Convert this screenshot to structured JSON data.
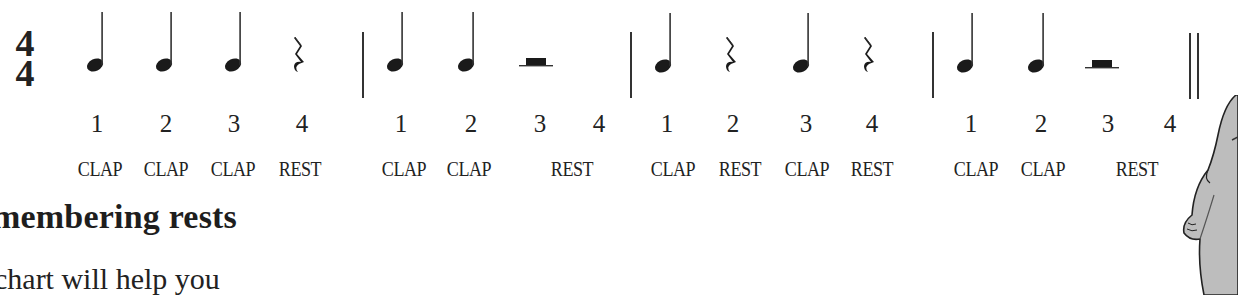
{
  "time_signature": {
    "top": "4",
    "bottom": "4"
  },
  "measures": [
    {
      "symbols": [
        {
          "type": "quarter-note",
          "beat": "1",
          "label": "CLAP"
        },
        {
          "type": "quarter-note",
          "beat": "2",
          "label": "CLAP"
        },
        {
          "type": "quarter-note",
          "beat": "3",
          "label": "CLAP"
        },
        {
          "type": "quarter-rest",
          "beat": "4",
          "label": "REST"
        }
      ]
    },
    {
      "symbols": [
        {
          "type": "quarter-note",
          "beat": "1",
          "label": "CLAP"
        },
        {
          "type": "quarter-note",
          "beat": "2",
          "label": "CLAP"
        },
        {
          "type": "half-rest",
          "beat": "3",
          "label": "REST"
        },
        {
          "type": "none",
          "beat": "4",
          "label": ""
        }
      ]
    },
    {
      "symbols": [
        {
          "type": "quarter-note",
          "beat": "1",
          "label": "CLAP"
        },
        {
          "type": "quarter-rest",
          "beat": "2",
          "label": "REST"
        },
        {
          "type": "quarter-note",
          "beat": "3",
          "label": "CLAP"
        },
        {
          "type": "quarter-rest",
          "beat": "4",
          "label": "REST"
        }
      ]
    },
    {
      "symbols": [
        {
          "type": "quarter-note",
          "beat": "1",
          "label": "CLAP"
        },
        {
          "type": "quarter-note",
          "beat": "2",
          "label": "CLAP"
        },
        {
          "type": "half-rest",
          "beat": "3",
          "label": "REST"
        },
        {
          "type": "none",
          "beat": "4",
          "label": ""
        }
      ]
    }
  ],
  "beats": [
    "1",
    "2",
    "3",
    "4",
    "1",
    "2",
    "3",
    "4",
    "1",
    "2",
    "3",
    "4",
    "1",
    "2",
    "3",
    "4"
  ],
  "labels": {
    "m1": [
      "CLAP",
      "CLAP",
      "CLAP",
      "REST"
    ],
    "m2": [
      "CLAP",
      "CLAP",
      "REST"
    ],
    "m3": [
      "CLAP",
      "REST",
      "CLAP",
      "REST"
    ],
    "m4": [
      "CLAP",
      "CLAP",
      "REST"
    ]
  },
  "section": {
    "heading": "membering rests",
    "body": "chart will help you"
  },
  "colors": {
    "ink": "#1a1a1a",
    "cartoon_fill": "#bdbdbd",
    "background": "#ffffff"
  }
}
